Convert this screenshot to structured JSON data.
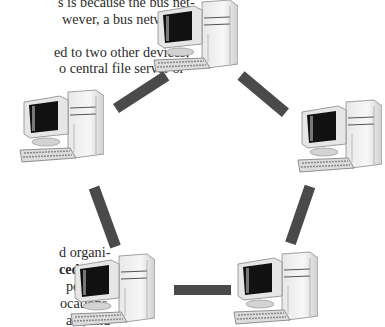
{
  "text_top": [
    {
      "text": "s is because the bus net-",
      "x": 58,
      "y": -6
    },
    {
      "text": "wever, a bus network is",
      "x": 62,
      "y": 11
    },
    {
      "text": "ed to two other devices,",
      "x": 54,
      "y": 44
    },
    {
      "text": "o central file server or",
      "x": 59,
      "y": 60
    }
  ],
  "text_bottom": [
    {
      "text": "d organi-",
      "x": 59,
      "y": 244,
      "bold": false
    },
    {
      "text": "ced data",
      "x": 59,
      "y": 261,
      "bold": true
    },
    {
      "text": "perform",
      "x": 66,
      "y": 278,
      "bold": false
    },
    {
      "text": "ocations.",
      "x": 60,
      "y": 295,
      "bold": false
    },
    {
      "text": "ata, and",
      "x": 66,
      "y": 312,
      "bold": false
    }
  ],
  "diagram": {
    "type": "ring-network",
    "nodes": [
      {
        "id": "top",
        "label": "computer-top",
        "x": 152,
        "y": 0
      },
      {
        "id": "left",
        "label": "computer-left",
        "x": 18,
        "y": 87
      },
      {
        "id": "right",
        "label": "computer-right",
        "x": 296,
        "y": 97
      },
      {
        "id": "bottom-left",
        "label": "computer-bottom-left",
        "x": 69,
        "y": 252
      },
      {
        "id": "bottom-right",
        "label": "computer-bottom-right",
        "x": 232,
        "y": 250
      }
    ],
    "links_color": "#4a4a4a"
  }
}
